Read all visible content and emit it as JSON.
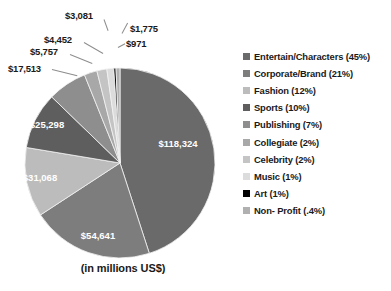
{
  "caption": "(in millions US$)",
  "cropped_title": "",
  "chart_data": {
    "type": "pie",
    "title": "",
    "subtitle": "(in millions US$)",
    "units": "millions US$",
    "start_angle_deg": 0,
    "direction": "clockwise",
    "legend_position": "right",
    "grid": false,
    "categories": [
      "Entertain/Characters",
      "Corporate/Brand",
      "Fashion",
      "Sports",
      "Publishing",
      "Collegiate",
      "Celebrity",
      "Music",
      "Art",
      "Non- Profit"
    ],
    "values": [
      118324,
      54641,
      31068,
      25298,
      17513,
      5757,
      4452,
      3081,
      971,
      1775
    ],
    "percents": [
      45,
      21,
      12,
      10,
      7,
      2,
      2,
      1,
      1,
      0.4
    ],
    "value_labels": [
      "$118,324",
      "$54,641",
      "$31,068",
      "$25,298",
      "$17,513",
      "$5,757",
      "$4,452",
      "$3,081",
      "$971",
      "$1,775"
    ],
    "percent_labels": [
      "(45%)",
      "(21%)",
      "(12%)",
      "(10%)",
      "(7%)",
      "(2%)",
      "(2%)",
      "(1%)",
      "(1%)",
      "(.4%)"
    ],
    "colors": [
      "#6a6a6a",
      "#7d7d7d",
      "#bcbcbc",
      "#5e5e5e",
      "#8e8e8e",
      "#a8a8a8",
      "#c4c4c4",
      "#dcdcdc",
      "#000000",
      "#b0b0b0"
    ]
  },
  "legend": {
    "items": [
      {
        "label": "Entertain/Characters (45%)",
        "color": "#6a6a6a"
      },
      {
        "label": "Corporate/Brand (21%)",
        "color": "#7d7d7d"
      },
      {
        "label": "Fashion (12%)",
        "color": "#bcbcbc"
      },
      {
        "label": "Sports (10%)",
        "color": "#5e5e5e"
      },
      {
        "label": "Publishing (7%)",
        "color": "#8e8e8e"
      },
      {
        "label": "Collegiate (2%)",
        "color": "#a8a8a8"
      },
      {
        "label": "Celebrity (2%)",
        "color": "#c4c4c4"
      },
      {
        "label": "Music (1%)",
        "color": "#dcdcdc"
      },
      {
        "label": "Art (1%)",
        "color": "#000000"
      },
      {
        "label": "Non- Profit (.4%)",
        "color": "#b0b0b0"
      }
    ]
  },
  "inside_labels": [
    {
      "text": "$118,324",
      "x": 178,
      "y": 147
    },
    {
      "text": "$54,641",
      "x": 98,
      "y": 239
    },
    {
      "text": "$31,068",
      "x": 40,
      "y": 181
    },
    {
      "text": "$25,298",
      "x": 47,
      "y": 128
    }
  ],
  "callouts": [
    {
      "text": "$17,513",
      "x": 8,
      "y": 63
    },
    {
      "text": "$5,757",
      "x": 30,
      "y": 46
    },
    {
      "text": "$4,452",
      "x": 44,
      "y": 34
    },
    {
      "text": "$3,081",
      "x": 65,
      "y": 10
    },
    {
      "text": "$1,775",
      "x": 130,
      "y": 23
    },
    {
      "text": "$971",
      "x": 126,
      "y": 38
    }
  ]
}
